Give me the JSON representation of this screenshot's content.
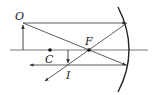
{
  "diagram": {
    "labels": {
      "object": "O",
      "focus": "F",
      "center": "C",
      "image": "I"
    },
    "colors": {
      "line": "#333333",
      "background": "#ffffff"
    }
  }
}
